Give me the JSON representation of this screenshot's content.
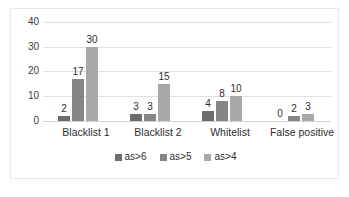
{
  "chart_data": {
    "type": "bar",
    "title": "",
    "subtitle": "",
    "xlabel": "",
    "ylabel": "",
    "categories": [
      "Blacklist 1",
      "Blacklist 2",
      "Whitelist",
      "False positive"
    ],
    "series": [
      {
        "name": "as>6",
        "color": "#6d6d6d",
        "values": [
          2,
          3,
          4,
          0
        ]
      },
      {
        "name": "as>5",
        "color": "#858585",
        "values": [
          17,
          3,
          8,
          2
        ]
      },
      {
        "name": "as>4",
        "color": "#a8a8a8",
        "values": [
          30,
          15,
          10,
          3
        ]
      }
    ],
    "ylim": [
      0,
      40
    ],
    "yticks": [
      0,
      10,
      20,
      30,
      40
    ],
    "ytick_labels": [
      "0",
      "10",
      "20",
      "30",
      "40"
    ],
    "grid": true,
    "grid_axis": "y",
    "legend_position": "bottom",
    "data_labels": true,
    "data_labels_values": [
      [
        "2",
        "17",
        "30"
      ],
      [
        "3",
        "3",
        "15"
      ],
      [
        "4",
        "8",
        "10"
      ],
      [
        "0",
        "2",
        "3"
      ]
    ],
    "plot_background": "#ffffff",
    "border_color": "#e8e8e8",
    "gridline_color": "#e0e0e0",
    "axis_text_color": "#3d3d3d"
  }
}
